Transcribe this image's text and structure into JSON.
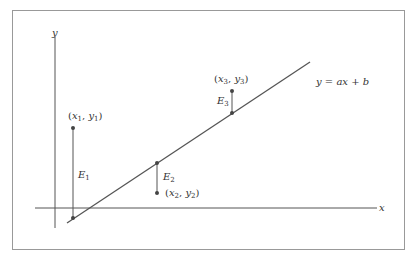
{
  "diagram": {
    "type": "linear-regression-residuals",
    "axes": {
      "x_label": "x",
      "y_label": "y"
    },
    "line_label": "y = ax + b",
    "points": [
      {
        "id": 1,
        "label": "(x1, y1)",
        "residual_label": "E1",
        "x_sym": "x",
        "y_sym": "y",
        "sub": "1"
      },
      {
        "id": 2,
        "label": "(x2, y2)",
        "residual_label": "E2",
        "x_sym": "x",
        "y_sym": "y",
        "sub": "2"
      },
      {
        "id": 3,
        "label": "(x3, y3)",
        "residual_label": "E3",
        "x_sym": "x",
        "y_sym": "y",
        "sub": "3"
      }
    ],
    "colors": {
      "line": "#555555",
      "frame": "#999999",
      "point": "#444444",
      "text": "#333333"
    }
  }
}
